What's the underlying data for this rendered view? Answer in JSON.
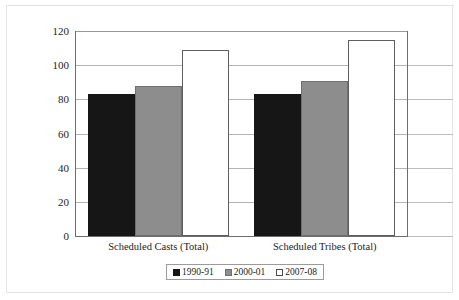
{
  "chart_data": {
    "type": "bar",
    "title": "",
    "xlabel": "",
    "ylabel": "",
    "categories": [
      "Scheduled Casts (Total)",
      "Scheduled Tribes (Total)"
    ],
    "series": [
      {
        "name": "1990-91",
        "values": [
          83,
          83
        ],
        "color": "#161616"
      },
      {
        "name": "2000-01",
        "values": [
          88,
          91
        ],
        "color": "#8d8d8d"
      },
      {
        "name": "2007-08",
        "values": [
          109,
          115
        ],
        "color": "#ffffff"
      }
    ],
    "ylim": [
      0,
      120
    ],
    "yticks": [
      0,
      20,
      40,
      60,
      80,
      100,
      120
    ],
    "ytick_labels": [
      "0",
      "20",
      "40",
      "60",
      "80",
      "100",
      "120"
    ],
    "grid": true,
    "legend_position": "bottom"
  },
  "legend": {
    "entries": [
      {
        "label": "1990-91"
      },
      {
        "label": "2000-01"
      },
      {
        "label": "2007-08"
      }
    ]
  }
}
